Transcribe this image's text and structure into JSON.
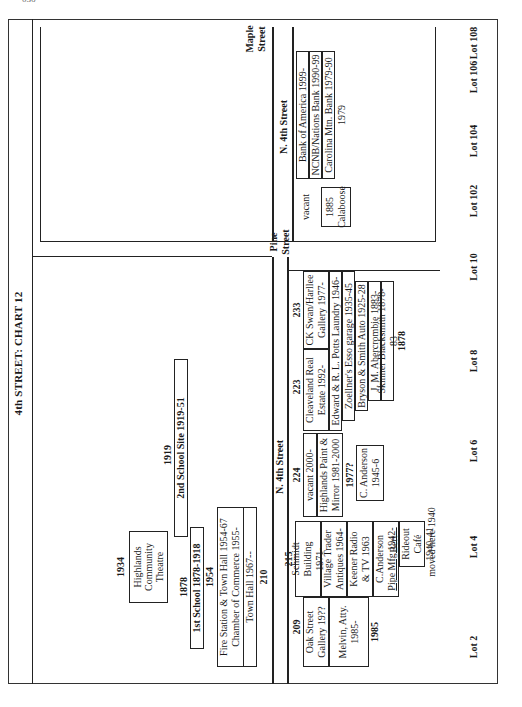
{
  "page_number": "036",
  "title": "4th STREET: CHART 12",
  "streets": {
    "oak": "Oak Street",
    "pine": [
      "Pine",
      "Street"
    ],
    "maple": [
      "Maple",
      "Street"
    ],
    "n4th_left": "N. 4th Street",
    "n4th_right": "N. 4th Street"
  },
  "upper_block": {
    "theatre": {
      "year": "1934",
      "lines": [
        "Highlands",
        "Community",
        "Theatre"
      ]
    },
    "school1": {
      "year": "1878",
      "label": "1st School 1878-1918"
    },
    "lot210": {
      "year": "1954",
      "lines": [
        "Fire Station & Town Hall 1954-67",
        "Chamber of Commerce 1955-",
        "Town Hall 1967--"
      ],
      "number": "210"
    },
    "school2": {
      "year": "1919",
      "label": "2nd School Site 1919-51"
    }
  },
  "lower_block": {
    "lot209": {
      "number": "209",
      "cells": [
        [
          "Oak Street",
          "Gallery 19??"
        ],
        [
          "Melvin, Atty.",
          "1985-"
        ]
      ],
      "year": "1985"
    },
    "lot215": {
      "number": "215",
      "cells": [
        [
          "Schmidt Building",
          "1971-"
        ],
        [
          "Village Trader",
          "Antiques 1964-"
        ],
        [
          "Keener Radio",
          "& TV 1963"
        ],
        [
          "C.Anderson",
          "Pipe Mfg 1942-"
        ],
        [
          "Bert Rideout",
          "Café 1940-41"
        ]
      ],
      "note": "moved here 1940"
    },
    "lot224": {
      "number": "224",
      "cells": [
        [
          "vacant 2000-"
        ],
        [
          "Highlands Paint &",
          "Mirror 1981-2000"
        ],
        [
          "1977?"
        ]
      ],
      "second_box": [
        "C. Anderson",
        "1945-6"
      ]
    },
    "lot223": {
      "number": "223",
      "cells": [
        [
          "Cleaveland Real",
          "Estate 1992-"
        ]
      ]
    },
    "lot233": {
      "number": "233",
      "cells": [
        [
          "CK Swan/Harllee",
          "Gallery 1977-"
        ]
      ]
    },
    "shared_rows": [
      "Edward & R. L. Potts Laundry 1946-",
      "Zoellner's Esso garage 1935-45",
      "Bryson & Smith Auto 1925-28",
      "J. M. Abercrombie 1883-",
      "Skinner Blacksmith 1878-83"
    ],
    "shared_year": "1878"
  },
  "east_block": {
    "vacant": "vacant",
    "calaboose": [
      "1885",
      "Calaboose"
    ],
    "banks": [
      "Bank of America 1999-",
      "NCNB/Nations Bank 1990-99",
      "Carolina Mtn. Bank 1979-90"
    ],
    "bank_year": "1979"
  },
  "lots": [
    "Lot 2",
    "Lot 4",
    "Lot 6",
    "Lot 8",
    "Lot 10",
    "Lot 102",
    "Lot 104",
    "Lot 106",
    "Lot 108"
  ]
}
